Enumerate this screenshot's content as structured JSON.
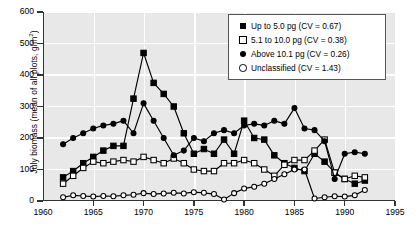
{
  "chart_data": {
    "type": "line",
    "title": "",
    "xlabel": "",
    "ylabel": "July biomass (mean of all plots, g/m2)",
    "ylabel_parts": {
      "main": "July biomass (mean of all plots, g/m",
      "sup": "2",
      "tail": ")"
    },
    "xlim": [
      1960,
      1995
    ],
    "ylim": [
      0,
      600
    ],
    "xticks": [
      1960,
      1965,
      1970,
      1975,
      1980,
      1985,
      1990,
      1995
    ],
    "yticks": [
      0,
      100,
      200,
      300,
      400,
      500,
      600
    ],
    "grid": true,
    "grid_color": "#ffffff",
    "plot_background": "#e8e8e8",
    "legend_position": "top-right",
    "x": [
      1962,
      1963,
      1964,
      1965,
      1966,
      1967,
      1968,
      1969,
      1970,
      1971,
      1972,
      1973,
      1974,
      1975,
      1976,
      1977,
      1978,
      1979,
      1980,
      1981,
      1982,
      1983,
      1984,
      1985,
      1986,
      1987,
      1988,
      1989,
      1990,
      1991,
      1992
    ],
    "series": [
      {
        "name": "Up to 5.0 pg (CV = 0.67)",
        "cv": 0.67,
        "marker": "filled-square",
        "color": "#000000",
        "values": [
          75,
          95,
          120,
          140,
          160,
          175,
          175,
          325,
          470,
          375,
          340,
          300,
          215,
          150,
          165,
          150,
          195,
          150,
          255,
          200,
          195,
          145,
          120,
          105,
          95,
          150,
          125,
          90,
          70,
          55,
          65
        ]
      },
      {
        "name": "5.1 to 10.0 pg (CV = 0.38)",
        "cv": 0.38,
        "marker": "open-square",
        "color": "#000000",
        "values": [
          55,
          80,
          105,
          125,
          120,
          125,
          130,
          125,
          140,
          130,
          120,
          135,
          120,
          100,
          95,
          95,
          120,
          120,
          130,
          120,
          100,
          80,
          115,
          130,
          130,
          160,
          195,
          90,
          70,
          80,
          75
        ]
      },
      {
        "name": "Above 10.1 pg (CV = 0.26)",
        "cv": 0.26,
        "marker": "filled-circle",
        "color": "#000000",
        "values": [
          180,
          200,
          215,
          230,
          240,
          245,
          255,
          215,
          310,
          255,
          200,
          145,
          160,
          200,
          190,
          215,
          225,
          215,
          240,
          245,
          240,
          255,
          245,
          295,
          230,
          225,
          190,
          70,
          150,
          155,
          150
        ]
      },
      {
        "name": "Unclassified (CV = 1.43)",
        "cv": 1.43,
        "marker": "open-circle",
        "color": "#000000",
        "values": [
          12,
          18,
          16,
          14,
          16,
          15,
          18,
          20,
          25,
          22,
          24,
          26,
          24,
          28,
          26,
          22,
          5,
          25,
          40,
          45,
          55,
          70,
          85,
          100,
          100,
          8,
          12,
          15,
          14,
          18,
          35
        ]
      }
    ]
  },
  "legend": {
    "items": [
      {
        "label": "Up to 5.0 pg (CV = 0.67)",
        "marker": "filled-square"
      },
      {
        "label": "5.1 to 10.0 pg (CV = 0.38)",
        "marker": "open-square"
      },
      {
        "label": "Above 10.1 pg (CV = 0.26)",
        "marker": "filled-circle"
      },
      {
        "label": "Unclassified (CV = 1.43)",
        "marker": "open-circle"
      }
    ]
  }
}
